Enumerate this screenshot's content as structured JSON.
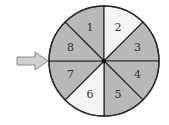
{
  "spinner": {
    "center": [
      104,
      61
    ],
    "radius": 55,
    "colors": {
      "shaded": "#b8b8b8",
      "light": "#f4f4f4",
      "stroke": "#2a2a2a",
      "arrow_fill": "#cfcfcf",
      "arrow_stroke": "#8a8a8a"
    },
    "sectors": [
      {
        "label": "1",
        "shade": "shaded"
      },
      {
        "label": "2",
        "shade": "light"
      },
      {
        "label": "3",
        "shade": "shaded"
      },
      {
        "label": "4",
        "shade": "shaded"
      },
      {
        "label": "5",
        "shade": "shaded"
      },
      {
        "label": "6",
        "shade": "light"
      },
      {
        "label": "7",
        "shade": "shaded"
      },
      {
        "label": "8",
        "shade": "shaded"
      }
    ],
    "arrow": {
      "direction": "right",
      "points_to_angle_deg": 180
    }
  }
}
